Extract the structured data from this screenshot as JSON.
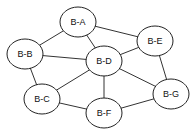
{
  "diagram": {
    "type": "undirected-graph",
    "nodes": [
      {
        "id": "A",
        "label": "B-A",
        "x": 78,
        "y": 22
      },
      {
        "id": "B",
        "label": "B-B",
        "x": 25,
        "y": 54
      },
      {
        "id": "C",
        "label": "B-C",
        "x": 42,
        "y": 99
      },
      {
        "id": "D",
        "label": "B-D",
        "x": 104,
        "y": 61
      },
      {
        "id": "E",
        "label": "B-E",
        "x": 155,
        "y": 41
      },
      {
        "id": "F",
        "label": "B-F",
        "x": 104,
        "y": 113
      },
      {
        "id": "G",
        "label": "B-G",
        "x": 171,
        "y": 94
      }
    ],
    "edges": [
      [
        "A",
        "B"
      ],
      [
        "A",
        "D"
      ],
      [
        "A",
        "E"
      ],
      [
        "B",
        "D"
      ],
      [
        "B",
        "C"
      ],
      [
        "C",
        "D"
      ],
      [
        "C",
        "F"
      ],
      [
        "D",
        "E"
      ],
      [
        "D",
        "F"
      ],
      [
        "D",
        "G"
      ],
      [
        "E",
        "G"
      ],
      [
        "F",
        "G"
      ]
    ],
    "colors": {
      "stroke": "#222222",
      "fill": "#ffffff",
      "background": "#ffffff"
    }
  }
}
